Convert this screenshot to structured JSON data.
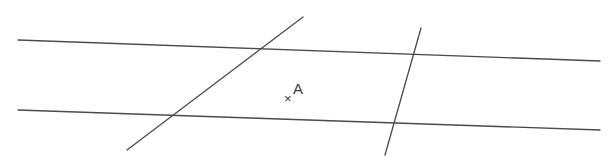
{
  "figure": {
    "background_color": "#ffffff",
    "stroke_color": "#4a4a4a",
    "label_color": "#3a3a3a",
    "width": 614,
    "height": 156,
    "lines": [
      {
        "name": "upper-parallel-line",
        "role": "parallel",
        "x1": 18,
        "y1": 40,
        "x2": 600,
        "y2": 61,
        "stroke_width": 1.3
      },
      {
        "name": "lower-parallel-line",
        "role": "parallel",
        "x1": 18,
        "y1": 110,
        "x2": 600,
        "y2": 130,
        "stroke_width": 1.3
      },
      {
        "name": "left-transversal-line",
        "role": "transversal",
        "x1": 303,
        "y1": 17,
        "x2": 127,
        "y2": 150,
        "stroke_width": 1.3
      },
      {
        "name": "right-transversal-line",
        "role": "transversal",
        "x1": 421,
        "y1": 28,
        "x2": 385,
        "y2": 155,
        "stroke_width": 1.3
      }
    ],
    "points": [
      {
        "name": "point-a",
        "label": "A",
        "marker": "×",
        "marker_x": 284,
        "marker_y": 103,
        "label_x": 293,
        "label_y": 94
      }
    ]
  }
}
